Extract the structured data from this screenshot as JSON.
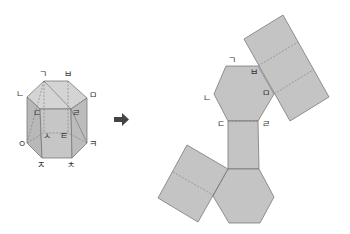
{
  "colors": {
    "face": "#c4c4c4",
    "face_light": "#d8d8d8",
    "face_dark": "#b0b0b0",
    "edge": "#7a7a7a",
    "arrow": "#444444"
  },
  "prism": {
    "labels": {
      "g": "ㄱ",
      "b": "ㅂ",
      "m": "ㅁ",
      "n": "ㄴ",
      "d": "ㄷ",
      "r": "ㄹ",
      "s": "ㅅ",
      "t": "ㅌ",
      "o": "ㅇ",
      "k": "ㅋ",
      "j": "ㅈ",
      "ch": "ㅊ"
    }
  },
  "arrow": {
    "glyph": "➡"
  },
  "net": {
    "labels": {
      "g": "ㄱ",
      "b": "ㅂ",
      "n": "ㄴ",
      "m": "ㅁ",
      "d": "ㄷ",
      "r": "ㄹ"
    }
  }
}
